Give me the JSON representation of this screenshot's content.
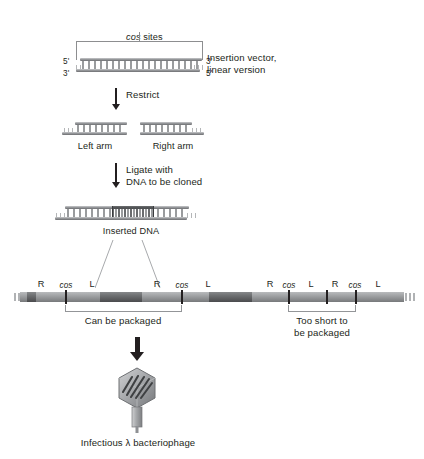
{
  "figure": {
    "background_color": "#ffffff",
    "ink_color": "#231f20",
    "dna_light_color": "#a5a7a9",
    "dna_dark_color": "#5c5e60"
  },
  "top": {
    "cos_sites_label": "cos",
    "cos_sites_label_suffix": " sites",
    "five_prime_left": "5'",
    "three_prime_left": "3'",
    "three_prime_right": "3'",
    "five_prime_right": "5'",
    "vector_caption_line1": "Insertion vector,",
    "vector_caption_line2": "linear version"
  },
  "steps": {
    "restrict": "Restrict",
    "ligate_line1": "Ligate with",
    "ligate_line2": "DNA to be cloned"
  },
  "arms": {
    "left_arm_label": "Left arm",
    "right_arm_label": "Right arm"
  },
  "ligated": {
    "inserted_dna_label": "Inserted DNA"
  },
  "concatemer": {
    "markers": [
      {
        "label": "R",
        "italic": false,
        "x": 41
      },
      {
        "label": "cos",
        "italic": true,
        "x": 66
      },
      {
        "label": "L",
        "italic": false,
        "x": 92
      },
      {
        "label": "R",
        "italic": false,
        "x": 157
      },
      {
        "label": "cos",
        "italic": true,
        "x": 182
      },
      {
        "label": "L",
        "italic": false,
        "x": 208
      },
      {
        "label": "R",
        "italic": false,
        "x": 270
      },
      {
        "label": "cos",
        "italic": true,
        "x": 288
      },
      {
        "label": "L",
        "italic": false,
        "x": 311
      },
      {
        "label": "R",
        "italic": false,
        "x": 335
      },
      {
        "label": "cos",
        "italic": true,
        "x": 355
      },
      {
        "label": "L",
        "italic": false,
        "x": 378
      }
    ],
    "can_be_packaged": "Can be packaged",
    "too_short_line1": "Too short to",
    "too_short_line2": "be packaged"
  },
  "bottom": {
    "phage_caption_prefix": "Infectious ",
    "phage_caption_lambda": "λ",
    "phage_caption_suffix": " bacteriophage",
    "phage_caption_full": "Infectious λ bacteriophage"
  }
}
